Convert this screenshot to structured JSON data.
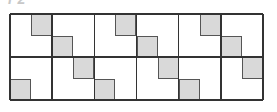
{
  "figure": {
    "label": "F2",
    "rows": 2,
    "columns": 6,
    "shade_color": "#d9d9d9",
    "line_color": "#333333",
    "cells": [
      [
        {
          "shaded_quadrant": "top-right"
        },
        {
          "shaded_quadrant": "bottom-left"
        },
        {
          "shaded_quadrant": "top-right"
        },
        {
          "shaded_quadrant": "bottom-left"
        },
        {
          "shaded_quadrant": "top-right"
        },
        {
          "shaded_quadrant": "bottom-left"
        }
      ],
      [
        {
          "shaded_quadrant": "bottom-left"
        },
        {
          "shaded_quadrant": "top-right"
        },
        {
          "shaded_quadrant": "bottom-left"
        },
        {
          "shaded_quadrant": "top-right"
        },
        {
          "shaded_quadrant": "bottom-left"
        },
        {
          "shaded_quadrant": "top-right"
        }
      ]
    ]
  }
}
